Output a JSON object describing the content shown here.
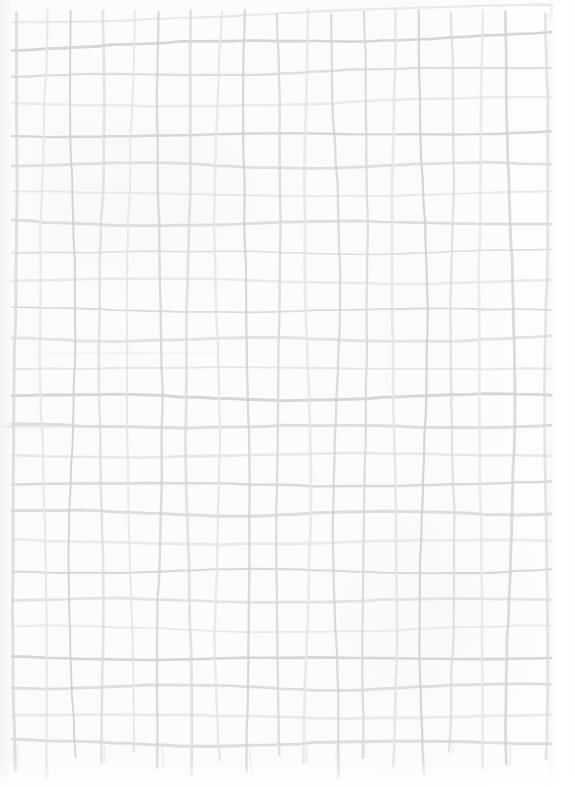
{
  "canvas": {
    "width": 575,
    "height": 787,
    "paper_color": "#fbfbfb",
    "paper_edge_color": "#ffffff",
    "title": "Hand-drawn grid on paper"
  },
  "drawing": {
    "kind": "hand-drawn-grid",
    "medium": "pencil on paper",
    "ink_color": "#d9dbdc",
    "ink_color_light": "#e4e6e7",
    "ink_color_dark": "#cfd2d3",
    "stroke_width_min": 1.7,
    "stroke_width_max": 3.0,
    "cell_size": 29,
    "vertical_line_count": 18,
    "horizontal_line_count": 25,
    "grid_left": 16,
    "grid_right": 545,
    "grid_top": 18,
    "grid_bottom": 742,
    "notes": "Wavy freehand lines; verticals overshoot below the lowest horizontal line with tapering tails."
  },
  "chart_data": {
    "type": "table",
    "xlabel": "",
    "ylabel": "",
    "columns": 18,
    "rows": 25,
    "grid": true,
    "legend": "none",
    "vertical_lines_x": [
      16,
      45,
      74,
      103,
      132,
      161,
      190,
      219,
      248,
      277,
      306,
      335,
      364,
      393,
      422,
      451,
      480,
      509,
      545
    ],
    "horizontal_lines_y": [
      22,
      48,
      77,
      106,
      135,
      164,
      193,
      222,
      251,
      280,
      309,
      338,
      367,
      396,
      425,
      454,
      483,
      512,
      541,
      570,
      599,
      628,
      657,
      686,
      715,
      742
    ],
    "vertical_tail_ends_y": [
      770,
      780,
      757,
      762,
      752,
      768,
      776,
      760,
      772,
      755,
      763,
      778,
      758,
      766,
      774,
      752,
      769,
      764,
      759
    ]
  }
}
